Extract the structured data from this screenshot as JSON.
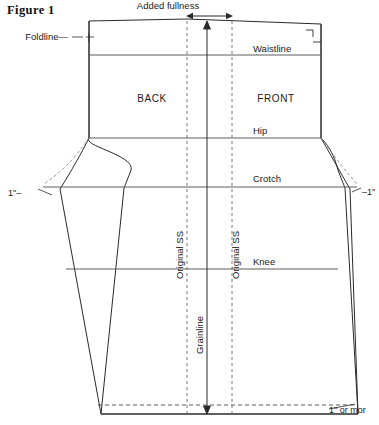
{
  "figure": {
    "title": "Figure 1",
    "kind": "sewing-pattern-diagram"
  },
  "labels": {
    "added_fullness": "Added fullness",
    "foldline": "Foldline—",
    "waistline": "Waistline",
    "back": "BACK",
    "front": "FRONT",
    "hip": "Hip",
    "crotch": "Crotch",
    "knee": "Knee",
    "grainline": "Grainline",
    "original_ss_left": "Original SS",
    "original_ss_right": "Original SS",
    "left_inch": "1\"–",
    "right_inch": "–1\"",
    "hem_note": "1\" or mor"
  },
  "colors": {
    "outline": "#2a2a2a",
    "guide": "#4a4a4a",
    "dashed": "#6b6b6b",
    "ghost": "#8a8a8a",
    "background": "#ffffff",
    "text": "#1a1a1a"
  },
  "geometry": {
    "grainline_x": 207,
    "dashed_left_x": 187,
    "dashed_right_x": 232,
    "top_y": 21,
    "hem_y": 414,
    "hem_fold_y": 405,
    "waistline_y": 55,
    "hip_y": 138,
    "crotch_y": 187,
    "knee_y": 269
  },
  "horizontal_lines": [
    {
      "name": "waistline",
      "y": 55
    },
    {
      "name": "hip",
      "y": 138
    },
    {
      "name": "crotch",
      "y": 187
    },
    {
      "name": "knee",
      "y": 269
    }
  ]
}
